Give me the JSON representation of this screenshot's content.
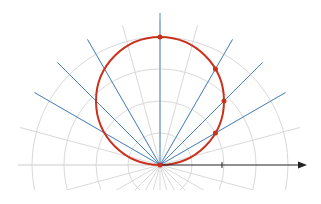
{
  "diagram": {
    "title": "",
    "watermark": "",
    "type": "polar-plot",
    "origin": {
      "x": 160,
      "y": 165
    },
    "ring_spacing_px": 32,
    "ring_count": 4,
    "colors": {
      "grid": "#d9d9d9",
      "ray_highlight": "#4a86c5",
      "curve": "#c8321e",
      "axis": "#222222",
      "background": "#ffffff"
    },
    "highlight_rays_deg": [
      30,
      45,
      60,
      90,
      120,
      135,
      150
    ],
    "grid_rays_step_deg": 15,
    "curve": {
      "equation": "r = 128·sin(θ)",
      "diameter_px": 128
    },
    "points_deg": [
      30,
      45,
      60,
      90
    ]
  }
}
